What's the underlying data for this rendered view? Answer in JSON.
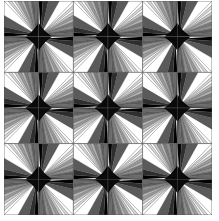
{
  "figure": {
    "title": "",
    "grid": {
      "rows": 6,
      "cols": 6,
      "block_size": 2
    },
    "tile_orientations": {
      "top_left": 0,
      "top_right": 90,
      "bottom_right": 180,
      "bottom_left": 270
    },
    "colors": {
      "background": "#ffffff",
      "outline": "#444444",
      "shades": [
        "#ffffff",
        "#d8d8d8",
        "#ffffff",
        "#c4c4c4",
        "#e6e6e6",
        "#a8a8a8",
        "#8c8c8c",
        "#b4b4b4",
        "#6e6e6e",
        "#8a8a8a",
        "#4e4e4e",
        "#5e5e5e",
        "#2e2e2e",
        "#111111",
        "#000000"
      ]
    }
  }
}
